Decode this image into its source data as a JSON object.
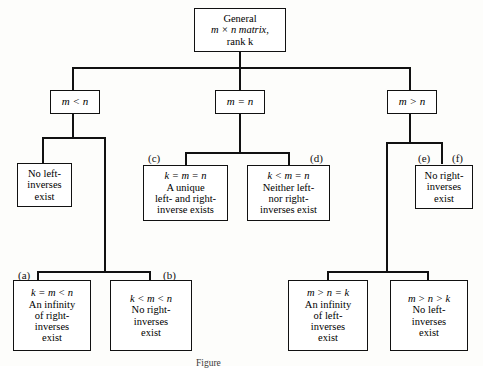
{
  "figure": {
    "caption": "Figure",
    "root": {
      "lines": [
        "General",
        "m × n matrix,",
        "rank k"
      ]
    },
    "branches": [
      {
        "label": "m < n"
      },
      {
        "label": "m = n"
      },
      {
        "label": "m > n"
      }
    ],
    "outcomes": {
      "no_left_inverses": {
        "lines": [
          "No left-",
          "inverses",
          "exist"
        ]
      },
      "no_right_inverses": {
        "lines": [
          "No right-",
          "inverses",
          "exist"
        ]
      },
      "case_c": {
        "tag": "(c)",
        "condition": "k = m = n",
        "lines": [
          "A unique",
          "left- and right-",
          "inverse exists"
        ]
      },
      "case_d": {
        "tag": "(d)",
        "condition": "k < m = n",
        "lines": [
          "Neither left-",
          "nor right-",
          "inverses exist"
        ]
      },
      "case_a": {
        "tag": "(a)",
        "condition": "k = m < n",
        "lines": [
          "An infinity",
          "of right-",
          "inverses",
          "exist"
        ]
      },
      "case_b": {
        "tag": "(b)",
        "condition": "k < m < n",
        "lines": [
          "No right-",
          "inverses",
          "exist"
        ]
      },
      "case_e": {
        "tag": "(e)"
      },
      "case_f": {
        "tag": "(f)"
      },
      "case_g": {
        "condition": "m > n = k",
        "lines": [
          "An infinity",
          "of left-",
          "inverses",
          "exist"
        ]
      },
      "case_h": {
        "condition": "m > n > k",
        "lines": [
          "No left-",
          "inverses",
          "exist"
        ]
      }
    }
  }
}
